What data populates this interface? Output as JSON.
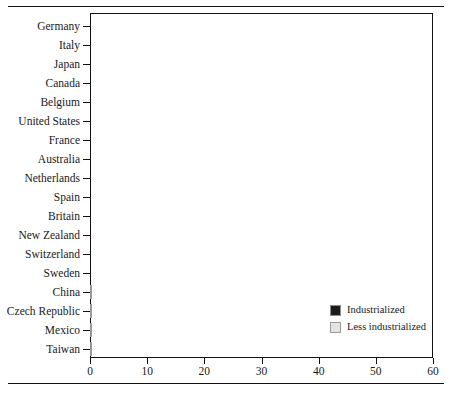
{
  "chart_data": {
    "type": "bar",
    "orientation": "horizontal",
    "title": "",
    "subtitle": "",
    "xlabel": "",
    "ylabel": "",
    "xlim": [
      0,
      60
    ],
    "xticks": [
      0,
      10,
      20,
      30,
      40,
      50,
      60
    ],
    "xtick_labels": [
      "0",
      "10",
      "20",
      "30",
      "40",
      "50",
      "60"
    ],
    "grid": false,
    "legend_position": "inside-bottom-right",
    "categories": [
      "Germany",
      "Italy",
      "Japan",
      "Canada",
      "Belgium",
      "United States",
      "France",
      "Australia",
      "Netherlands",
      "Spain",
      "Britain",
      "New Zealand",
      "Switzerland",
      "Sweden",
      "China",
      "Czech Republic",
      "Mexico",
      "Taiwan"
    ],
    "values": [
      57,
      53,
      50,
      44,
      39.5,
      39.5,
      37.5,
      36.5,
      36,
      34.5,
      33.5,
      33.5,
      29.5,
      28,
      29.5,
      38.5,
      33.5,
      24.8
    ],
    "groups": [
      "Industrialized",
      "Industrialized",
      "Industrialized",
      "Industrialized",
      "Industrialized",
      "Industrialized",
      "Industrialized",
      "Industrialized",
      "Industrialized",
      "Industrialized",
      "Industrialized",
      "Industrialized",
      "Industrialized",
      "Industrialized",
      "Less industrialized",
      "Less industrialized",
      "Less industrialized",
      "Less industrialized"
    ],
    "legend": [
      {
        "label": "Industrialized",
        "color": "#1b1b1b"
      },
      {
        "label": "Less industrialized",
        "color": "#e4e4e4"
      }
    ],
    "colors": {
      "industrialized": "#1b1b1b",
      "less_industrialized": "#d8d8d8",
      "axis": "#111111"
    }
  }
}
